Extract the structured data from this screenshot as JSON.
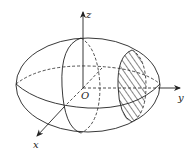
{
  "diagram": {
    "type": "3d-ellipsoid",
    "labels": {
      "origin": "O",
      "x_axis": "x",
      "y_axis": "y",
      "z_axis": "z"
    },
    "colors": {
      "stroke": "#222222",
      "background": "#ffffff"
    },
    "elements": [
      {
        "name": "outer-ellipsoid-outline",
        "style": "solid"
      },
      {
        "name": "equator-front",
        "style": "solid"
      },
      {
        "name": "equator-back",
        "style": "dashed"
      },
      {
        "name": "vertical-cross-section-front",
        "style": "solid"
      },
      {
        "name": "vertical-cross-section-back",
        "style": "dashed"
      },
      {
        "name": "hatched-cross-section",
        "style": "hatched"
      },
      {
        "name": "x-axis",
        "style": "solid-with-dashed-inner"
      },
      {
        "name": "y-axis",
        "style": "solid-with-dashed-inner"
      },
      {
        "name": "z-axis",
        "style": "solid"
      }
    ]
  }
}
